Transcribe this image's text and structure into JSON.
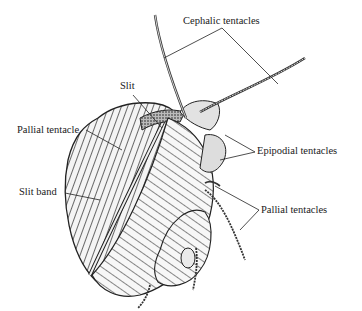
{
  "figure": {
    "labels": [
      {
        "id": "cephalic",
        "text": "Cephalic tentacles",
        "x": 183,
        "y": 16
      },
      {
        "id": "slit",
        "text": "Slit",
        "x": 120,
        "y": 81
      },
      {
        "id": "pallial-single",
        "text": "Pallial tentacle",
        "x": 17,
        "y": 125
      },
      {
        "id": "epipodial",
        "text": "Epipodial tentacles",
        "x": 257,
        "y": 148
      },
      {
        "id": "slit-band",
        "text": "Slit band",
        "x": 19,
        "y": 189
      },
      {
        "id": "pallial-plural",
        "text": "Pallial tentacles",
        "x": 261,
        "y": 205
      }
    ]
  }
}
